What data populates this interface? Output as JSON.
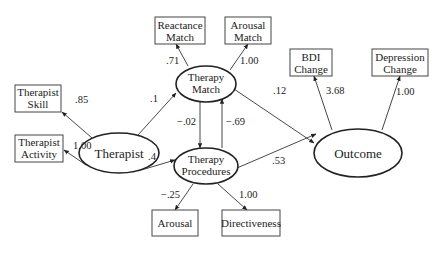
{
  "latent_variables": {
    "therapist": "Therapist",
    "therapy_match": [
      "Therapy",
      "Match"
    ],
    "therapy_procedures": [
      "Therapy",
      "Procedures"
    ],
    "outcome": "Outcome"
  },
  "indicators": {
    "therapist_skill": [
      "Therapist",
      "Skill"
    ],
    "therapist_activity": [
      "Therapist",
      "Activity"
    ],
    "reactance_match": [
      "Reactance",
      "Match"
    ],
    "arousal_match": [
      "Arousal",
      "Match"
    ],
    "bdi_change": [
      "BDI",
      "Change"
    ],
    "depression_change": [
      "Depression",
      "Change"
    ],
    "arousal": "Arousal",
    "directiveness": "Directiveness"
  },
  "coefficients": {
    "therapist_to_skill": ".85",
    "therapist_to_activity": "1.00",
    "therapist_to_match": ".1",
    "therapist_to_procedures": ".4",
    "match_to_reactance": ".71",
    "match_to_arousal_match": "1.00",
    "match_to_procedures": "−.02",
    "procedures_to_match": "−.69",
    "match_to_outcome": ".12",
    "procedures_to_outcome": ".53",
    "procedures_to_arousal": "−.25",
    "procedures_to_directiveness": "1.00",
    "outcome_to_bdi": "3.68",
    "outcome_to_depression": "1.00"
  }
}
